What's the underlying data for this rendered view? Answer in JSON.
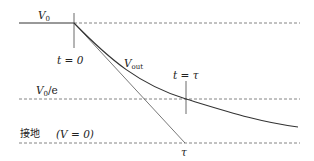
{
  "diagram": {
    "type": "rc-discharge-curve",
    "labels": {
      "v0": "V",
      "v0_sub": "0",
      "t0": "t = 0",
      "vout": "V",
      "vout_sub": "out",
      "t_tau": "t = τ",
      "v0e": "V",
      "v0e_sub": "0",
      "v0e_suffix": "/e",
      "ground": "接地",
      "ground_eq": "(V = 0)",
      "tau": "τ"
    },
    "levels": {
      "v0_y": 23,
      "v0e_y": 99,
      "ground_y": 143
    },
    "markers": {
      "t0_x": 74,
      "tau_x": 186
    },
    "colors": {
      "curve": "#333333",
      "tangent": "#555555",
      "dashed": "#666666",
      "text": "#222222"
    }
  }
}
